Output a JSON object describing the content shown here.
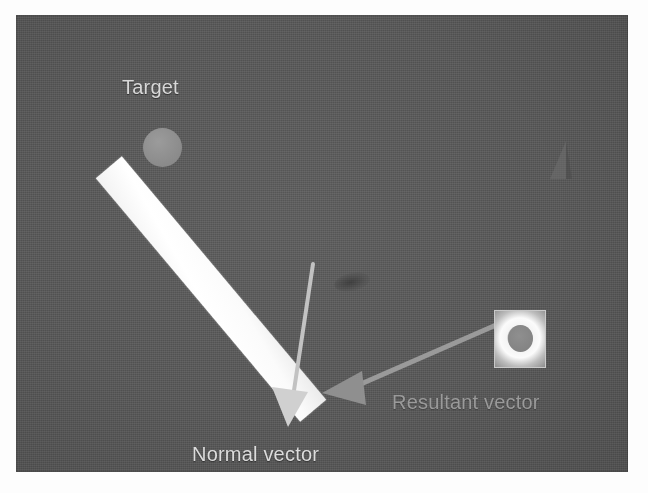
{
  "scene": {
    "title": "Collision normal and resultant vector diagram",
    "background_color": "#5a5a5a",
    "canvas": {
      "x": 16,
      "y": 15,
      "width": 612,
      "height": 457
    }
  },
  "labels": {
    "target": "Target",
    "normal_vector": "Normal vector",
    "resultant_vector": "Resultant vector"
  },
  "colors": {
    "canvas_background": "#5a5a5a",
    "paddle": "#ffffff",
    "target_circle": "#8d8d8d",
    "normal_vector_arrow": "#c8c8c8",
    "resultant_vector_arrow": "#8f8f8f",
    "label_bright": "#dcdcdc",
    "label_dim": "#9a9a9a",
    "ball_sprite_border": "#c9c9c9"
  },
  "objects": {
    "target_circle": {
      "cx": 146,
      "cy": 132,
      "r": 20
    },
    "paddle_bar": {
      "x": 178,
      "y": 115,
      "width": 34,
      "height": 318,
      "rotation_deg": -40
    },
    "ball_sprite": {
      "x": 478,
      "y": 295,
      "width": 50,
      "height": 56
    },
    "impact_marker": {
      "x": 318,
      "y": 258
    },
    "corner_triangle": {
      "x": 528,
      "y": 124
    }
  },
  "vectors": [
    {
      "name": "normal-vector",
      "label": "Normal vector",
      "from": {
        "x": 312,
        "y": 266
      },
      "to": {
        "x": 291,
        "y": 420
      },
      "color": "#c8c8c8",
      "shaft_width": 4,
      "head_width": 26,
      "head_length": 30
    },
    {
      "name": "resultant-vector",
      "label": "Resultant vector",
      "from": {
        "x": 487,
        "y": 323
      },
      "to": {
        "x": 322,
        "y": 393
      },
      "color": "#8f8f8f",
      "shaft_width": 5,
      "head_width": 28,
      "head_length": 32
    }
  ]
}
